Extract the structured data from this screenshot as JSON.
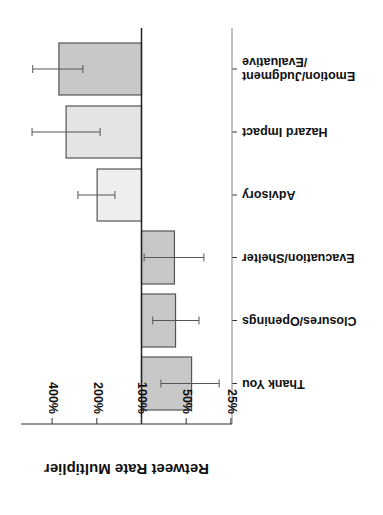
{
  "chart_data": {
    "type": "bar",
    "orientation": "horizontal",
    "rotation_deg": 180,
    "title": "",
    "xlabel": "Retweet Rate Multiplier",
    "ylabel": "",
    "x_scale": "log2",
    "xlim": [
      "25%",
      "400%+"
    ],
    "x_ticks": [
      "25%",
      "50%",
      "100%",
      "200%",
      "400%"
    ],
    "baseline": "100%",
    "grid": false,
    "legend": null,
    "categories": [
      "Thank You",
      "Closures/Openings",
      "Evacuation/Shelter",
      "Advisory",
      "Hazard Impact",
      "Emotion/Judgment/Evaluative"
    ],
    "category_labels": [
      [
        "Thank You"
      ],
      [
        "Closures/Openings"
      ],
      [
        "Evacuation/Shelter"
      ],
      [
        "Advisory"
      ],
      [
        "Hazard Impact"
      ],
      [
        "Emotion/Judgment",
        "/Evaluative"
      ]
    ],
    "values_percent": [
      46,
      59,
      60,
      199,
      322,
      360
    ],
    "error_low_percent": [
      30,
      41,
      38,
      151,
      190,
      248
    ],
    "error_high_percent": [
      74,
      84,
      96,
      268,
      546,
      540
    ],
    "bar_colors": [
      "#c8c8c8",
      "#c8c8c8",
      "#c8c8c8",
      "#eeeeee",
      "#e4e4e4",
      "#c8c8c8"
    ]
  },
  "style": {
    "axis_color": "#333333",
    "error_color": "#555555",
    "bar_stroke": "#555555"
  }
}
